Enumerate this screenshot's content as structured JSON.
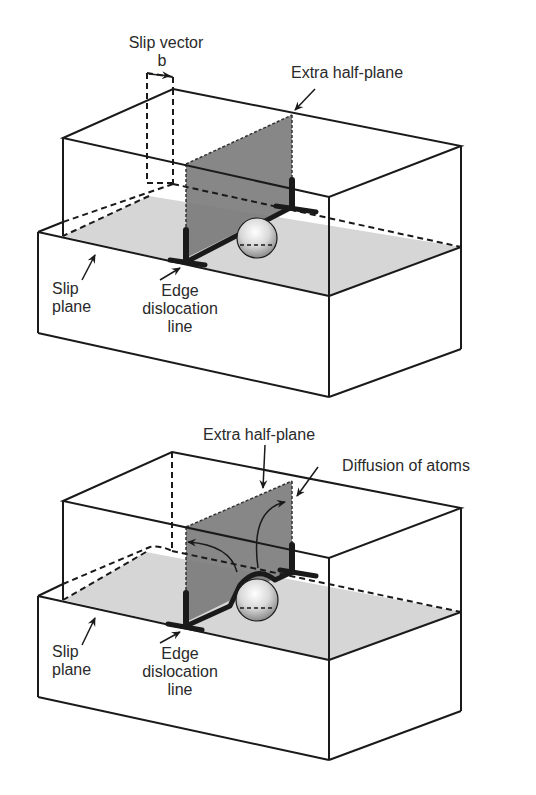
{
  "figure": {
    "top_panel": {
      "labels": {
        "slip_vector": "Slip vector",
        "b": "b",
        "extra_half_plane": "Extra half-plane",
        "slip_plane_line1": "Slip",
        "slip_plane_line2": "plane",
        "edge_line1": "Edge",
        "edge_line2": "dislocation",
        "edge_line3": "line"
      }
    },
    "bottom_panel": {
      "labels": {
        "extra_half_plane": "Extra half-plane",
        "diffusion": "Diffusion of atoms",
        "slip_plane_line1": "Slip",
        "slip_plane_line2": "plane",
        "edge_line1": "Edge",
        "edge_line2": "dislocation",
        "edge_line3": "line"
      }
    },
    "colors": {
      "line": "#1a1a1a",
      "slip_plane_fill": "#d6d6d6",
      "half_plane_fill": "#7a7a7a",
      "text": "#2a2a2a"
    }
  }
}
